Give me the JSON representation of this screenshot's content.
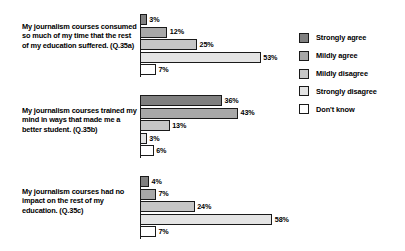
{
  "chart_data": {
    "type": "bar",
    "orientation": "horizontal",
    "title": "",
    "xlabel": "",
    "ylabel": "",
    "xlim": [
      0,
      60
    ],
    "grid": false,
    "legend_position": "right",
    "value_suffix": "%",
    "categories": [
      "My journalism courses consumed so much of my time that the rest of my education suffered. (Q.35a)",
      "My journalism courses trained my mind in ways that made me a better student. (Q.35b)",
      "My journalism courses had no impact on the rest of my education. (Q.35c)"
    ],
    "series": [
      {
        "name": "Strongly agree",
        "color": "#808080",
        "values": [
          3,
          36,
          4
        ]
      },
      {
        "name": "Mildly agree",
        "color": "#a8a8a8",
        "values": [
          12,
          43,
          7
        ]
      },
      {
        "name": "Mildly disagree",
        "color": "#c6c6c6",
        "values": [
          25,
          13,
          24
        ]
      },
      {
        "name": "Strongly disagree",
        "color": "#e4e4e4",
        "values": [
          53,
          3,
          58
        ]
      },
      {
        "name": "Don't know",
        "color": "#ffffff",
        "values": [
          7,
          6,
          7
        ]
      }
    ],
    "groups": [
      {
        "label": "My journalism courses consumed so much of my time that the rest of my education suffered. (Q.35a)",
        "question_id": "Q.35a",
        "bars": [
          {
            "series": "Strongly agree",
            "value": 3,
            "value_label": "3%"
          },
          {
            "series": "Mildly agree",
            "value": 12,
            "value_label": "12%"
          },
          {
            "series": "Mildly disagree",
            "value": 25,
            "value_label": "25%"
          },
          {
            "series": "Strongly disagree",
            "value": 53,
            "value_label": "53%"
          },
          {
            "series": "Don't know",
            "value": 7,
            "value_label": "7%"
          }
        ]
      },
      {
        "label": "My journalism courses trained my mind in ways that made me a better student. (Q.35b)",
        "question_id": "Q.35b",
        "bars": [
          {
            "series": "Strongly agree",
            "value": 36,
            "value_label": "36%"
          },
          {
            "series": "Mildly agree",
            "value": 43,
            "value_label": "43%"
          },
          {
            "series": "Mildly disagree",
            "value": 13,
            "value_label": "13%"
          },
          {
            "series": "Strongly disagree",
            "value": 3,
            "value_label": "3%"
          },
          {
            "series": "Don't know",
            "value": 6,
            "value_label": "6%"
          }
        ]
      },
      {
        "label": "My journalism courses had no impact on the rest of my education. (Q.35c)",
        "question_id": "Q.35c",
        "bars": [
          {
            "series": "Strongly agree",
            "value": 4,
            "value_label": "4%"
          },
          {
            "series": "Mildly agree",
            "value": 7,
            "value_label": "7%"
          },
          {
            "series": "Mildly disagree",
            "value": 24,
            "value_label": "24%"
          },
          {
            "series": "Strongly disagree",
            "value": 58,
            "value_label": "58%"
          },
          {
            "series": "Don't know",
            "value": 7,
            "value_label": "7%"
          }
        ]
      }
    ]
  },
  "legend": {
    "items": [
      {
        "label": "Strongly agree",
        "color": "#808080"
      },
      {
        "label": "Mildly agree",
        "color": "#a8a8a8"
      },
      {
        "label": "Mildly disagree",
        "color": "#c6c6c6"
      },
      {
        "label": "Strongly disagree",
        "color": "#e4e4e4"
      },
      {
        "label": "Don't know",
        "color": "#ffffff"
      }
    ]
  },
  "layout": {
    "px_per_percent": 2.28,
    "group_tops": [
      14,
      95,
      176
    ],
    "label_tops": [
      22,
      106,
      187
    ],
    "bar_height": 11,
    "bar_gap": 1.6
  }
}
